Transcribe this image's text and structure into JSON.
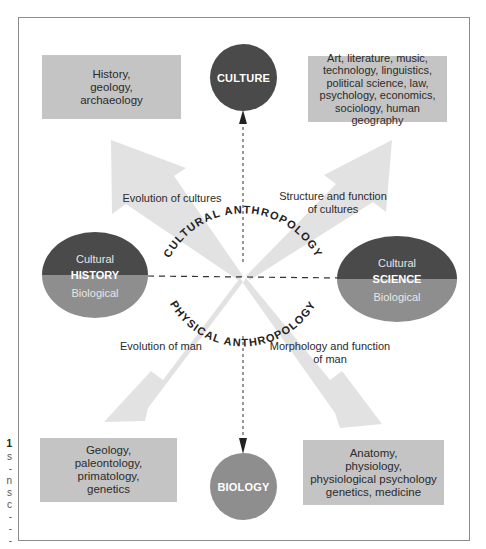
{
  "diagram": {
    "colors": {
      "frame_border": "#8c8c8c",
      "box_fill": "#c4c4c4",
      "arrow_fill": "#e2e2e2",
      "culture_circle": "#4a4a4a",
      "biology_circle": "#8e8e8e",
      "cultural_half": "#4a4a4a",
      "biological_half": "#8e8e8e"
    },
    "nodes": {
      "culture": {
        "label": "CULTURE"
      },
      "biology": {
        "label": "BIOLOGY"
      },
      "history": {
        "top": "Cultural",
        "middle": "HISTORY",
        "bottom": "Biological"
      },
      "science": {
        "top": "Cultural",
        "middle": "SCIENCE",
        "bottom": "Biological"
      }
    },
    "boxes": {
      "top_left": "History,\ngeology,\narchaeology",
      "top_right": "Art, literature, music,\ntechnology, linguistics,\npolitical science, law,\npsychology, economics,\nsociology, human geography",
      "bottom_left": "Geology,\npaleontology,\nprimatology,\ngenetics",
      "bottom_right": "Anatomy,\nphysiology,\nphysiological psychology\ngenetics, medicine"
    },
    "arrow_labels": {
      "top_left": "Evolution of cultures",
      "top_right": "Structure and function\nof cultures",
      "bottom_left": "Evolution of man",
      "bottom_right": "Morphology and function\nof man"
    },
    "arc_labels": {
      "upper": "CULTURAL ANTHROPOLOGY",
      "lower": "PHYSICAL ANTHROPOLOGY"
    },
    "edge_fragments": [
      "1",
      "s",
      "-",
      "n",
      "s",
      "c",
      "-",
      "-",
      "-"
    ]
  }
}
